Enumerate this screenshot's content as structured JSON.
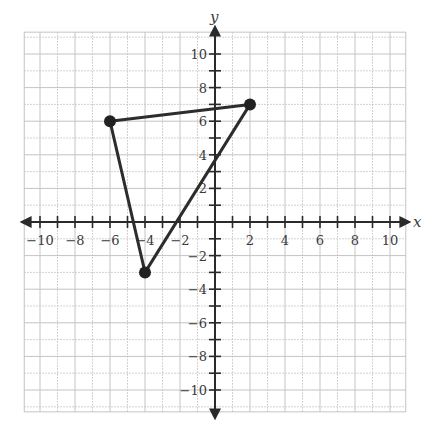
{
  "chart_data": {
    "type": "scatter",
    "title": "",
    "xlabel": "x",
    "ylabel": "y",
    "xlim": [
      -10.9,
      10.9
    ],
    "ylim": [
      -11.3,
      11.3
    ],
    "grid": true,
    "x_ticks": [
      -10,
      -8,
      -6,
      -4,
      -2,
      2,
      4,
      6,
      8,
      10
    ],
    "y_ticks": [
      10,
      8,
      6,
      4,
      2,
      -2,
      -4,
      -6,
      -8,
      -10
    ],
    "x_tick_labels": [
      "−10",
      "−8",
      "−6",
      "−4",
      "−2",
      "2",
      "4",
      "6",
      "8",
      "10"
    ],
    "y_tick_labels": [
      "10",
      "8",
      "6",
      "4",
      "2",
      "−2",
      "−4",
      "−6",
      "−8",
      "−10"
    ],
    "series": [
      {
        "name": "triangle",
        "closed": true,
        "points": [
          {
            "x": -6,
            "y": 6
          },
          {
            "x": 2,
            "y": 7
          },
          {
            "x": -4,
            "y": -3
          }
        ]
      }
    ]
  },
  "style": {
    "axis_color": "#2a2a2a",
    "grid_color": "#c4c4c4",
    "line_color": "#2d2d2d",
    "point_color": "#222222"
  }
}
